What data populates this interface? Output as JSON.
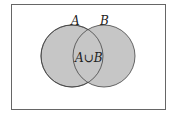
{
  "diagram": {
    "type": "venn",
    "sets": [
      {
        "label": "A",
        "fill": "#c8c8c8"
      },
      {
        "label": "B",
        "fill": "#c8c8c8"
      }
    ],
    "region_label": "A∪B",
    "universe_border": "#555555"
  }
}
